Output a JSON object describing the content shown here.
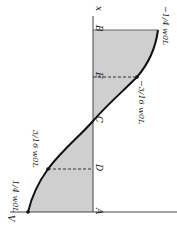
{
  "diagram": {
    "axis_labels": {
      "x": "x",
      "v": "V"
    },
    "points": [
      {
        "name": "A",
        "label": "A"
      },
      {
        "name": "D",
        "label": "D"
      },
      {
        "name": "C",
        "label": "C"
      },
      {
        "name": "E",
        "label": "E"
      },
      {
        "name": "B",
        "label": "B"
      }
    ],
    "values": [
      {
        "at": "A",
        "label": "1/4 w0L"
      },
      {
        "at": "D",
        "label": "3/16 w0L"
      },
      {
        "at": "E",
        "label": "−3/16 w0L"
      },
      {
        "at": "B",
        "label": "−1/4 w0L"
      }
    ],
    "colors": {
      "fill": "#cfcfcf",
      "curve": "#111111",
      "axis": "#444444"
    }
  }
}
